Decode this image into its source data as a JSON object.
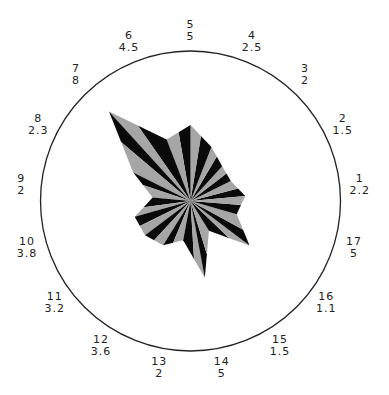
{
  "chart_data": {
    "type": "radar",
    "title": "",
    "axes_count": 17,
    "start_axis_at_top": 5,
    "direction": "counterclockwise",
    "axes": [
      {
        "id": "1",
        "value": "2.2",
        "radius_px": 55
      },
      {
        "id": "2",
        "value": "1.5",
        "radius_px": 45
      },
      {
        "id": "3",
        "value": "2",
        "radius_px": 47
      },
      {
        "id": "4",
        "value": "2.5",
        "radius_px": 58
      },
      {
        "id": "5",
        "value": "5",
        "radius_px": 76
      },
      {
        "id": "6",
        "value": "4.5",
        "radius_px": 66
      },
      {
        "id": "7",
        "value": "8",
        "radius_px": 121
      },
      {
        "id": "8",
        "value": "2.3",
        "radius_px": 64
      },
      {
        "id": "9",
        "value": "2",
        "radius_px": 38
      },
      {
        "id": "10",
        "value": "3.8",
        "radius_px": 58
      },
      {
        "id": "11",
        "value": "3.2",
        "radius_px": 57
      },
      {
        "id": "12",
        "value": "3.6",
        "radius_px": 52
      },
      {
        "id": "13",
        "value": "2",
        "radius_px": 40
      },
      {
        "id": "14",
        "value": "5",
        "radius_px": 78
      },
      {
        "id": "15",
        "value": "1.5",
        "radius_px": 35
      },
      {
        "id": "16",
        "value": "1.1",
        "radius_px": 74
      },
      {
        "id": "17",
        "value": "5",
        "radius_px": 48
      }
    ],
    "colors": {
      "dark": "#0a0a0a",
      "light": "#a6a6a6",
      "circle": "#222222"
    },
    "grid": false,
    "legend": null
  }
}
